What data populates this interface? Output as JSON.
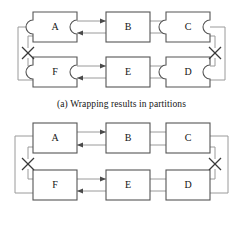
{
  "figure": {
    "type": "diagram",
    "panels": [
      {
        "id": "a",
        "caption": "(a) Wrapping results in partitions",
        "nodes_have_notches": true,
        "top_row": [
          "A",
          "B",
          "C"
        ],
        "bottom_row": [
          "F",
          "E",
          "D"
        ],
        "break_marks": [
          "left-break-x",
          "right-break-x"
        ],
        "break_count": 2
      },
      {
        "id": "b",
        "caption": "(b) Global hold maintains primary ring",
        "nodes_have_notches": false,
        "top_row": [
          "A",
          "B",
          "C"
        ],
        "bottom_row": [
          "F",
          "E",
          "D"
        ],
        "break_marks": [
          "left-break-x",
          "right-break-x"
        ],
        "break_count": 2
      }
    ],
    "colors": {
      "node_stroke": "#555555",
      "node_fill": "#ffffff",
      "wire": "#9a9a9a",
      "break_mark": "#3a3a3a",
      "text": "#141414",
      "background": "#ffffff"
    }
  }
}
